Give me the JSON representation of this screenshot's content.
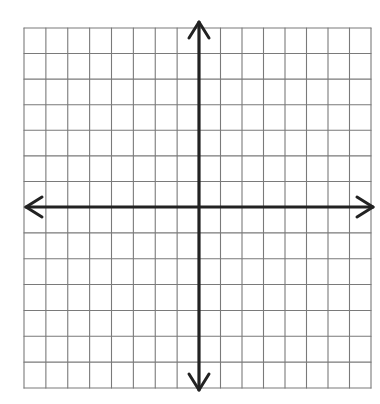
{
  "figure": {
    "type": "coordinate-grid",
    "grid": {
      "left": 24,
      "right": 371,
      "top": 28,
      "bottom": 388,
      "columns_left_of_axis": 8,
      "columns_right_of_axis": 8,
      "rows_above_axis": 7,
      "rows_below_axis": 7,
      "line_color": "#7a7a7a"
    },
    "axes": {
      "origin": [
        199,
        207
      ],
      "color": "#222222",
      "x_axis": {
        "from": 26,
        "to": 373
      },
      "y_axis": {
        "from": 22,
        "to": 390
      }
    }
  }
}
